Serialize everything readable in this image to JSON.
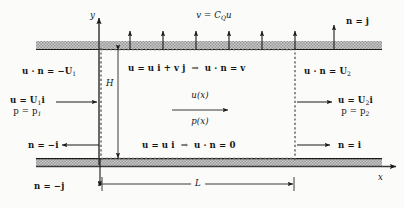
{
  "figure": {
    "kind": "control-volume fluid flow diagram",
    "axes": {
      "x_label": "x",
      "y_label": "y"
    },
    "dimensions": {
      "height_label": "H",
      "length_label": "L"
    },
    "boundaries": {
      "top_wall_condition": "v = C",
      "top_wall_condition_sub": "Q",
      "top_wall_condition_tail": "u",
      "top_normal": "n = j",
      "bottom_normal": "n = −j",
      "left_normal": "n = −i",
      "right_normal": "n = i",
      "inlet_flux": "u · n = −U",
      "inlet_flux_sub": "1",
      "outlet_flux": "u · n = U",
      "outlet_flux_sub": "2",
      "top_velocity_decomp": "u = u i + v j",
      "top_velocity_implies": "⇒",
      "top_velocity_result": "u · n = v",
      "bottom_velocity_decomp": "u = u i",
      "bottom_velocity_implies": "⇒",
      "bottom_velocity_result": "u · n = 0"
    },
    "inlet": {
      "velocity": "u = U",
      "velocity_sub": "1",
      "velocity_tail": "i",
      "pressure": "p = p",
      "pressure_sub": "1"
    },
    "outlet": {
      "velocity": "u = U",
      "velocity_sub": "2",
      "velocity_tail": "i",
      "pressure": "p = p",
      "pressure_sub": "2"
    },
    "interior": {
      "velocity_field": "u(x)",
      "pressure_field": "p(x)"
    },
    "colors": {
      "ink": "#141414",
      "wall_fill": "#b9b9b9",
      "dashed_boundary": "#6a6a6a",
      "background": "#fbfbf9"
    }
  }
}
